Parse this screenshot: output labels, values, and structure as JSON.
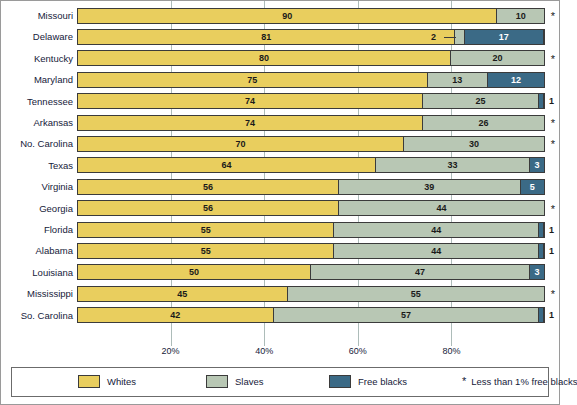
{
  "chart_data": {
    "type": "bar",
    "orientation": "horizontal",
    "stacked": true,
    "title": "",
    "xlabel": "",
    "ylabel": "",
    "xlim": [
      0,
      100
    ],
    "grid": true,
    "xticks": [
      "20%",
      "40%",
      "60%",
      "80%"
    ],
    "xtick_values": [
      20,
      40,
      60,
      80
    ],
    "legend_position": "bottom",
    "categories": [
      "Missouri",
      "Delaware",
      "Kentucky",
      "Maryland",
      "Tennessee",
      "Arkansas",
      "No. Carolina",
      "Texas",
      "Virginia",
      "Georgia",
      "Florida",
      "Alabama",
      "Louisiana",
      "Mississippi",
      "So. Carolina"
    ],
    "series": [
      {
        "name": "Whites",
        "color": "#e9ce5e",
        "values": [
          90,
          81,
          80,
          75,
          74,
          74,
          70,
          64,
          56,
          56,
          55,
          55,
          50,
          45,
          42
        ]
      },
      {
        "name": "Slaves",
        "color": "#b8c7b4",
        "values": [
          10,
          2,
          20,
          13,
          25,
          26,
          30,
          33,
          39,
          44,
          44,
          44,
          47,
          55,
          57
        ]
      },
      {
        "name": "Free blacks",
        "color": "#3b6a86",
        "values": [
          0,
          17,
          0,
          12,
          1,
          0,
          0,
          3,
          5,
          0,
          1,
          1,
          3,
          0,
          1
        ]
      }
    ],
    "footnote": "Less than 1% free blacks",
    "footnote_marker": "*",
    "rows": [
      {
        "label": "Missouri",
        "whites": 90,
        "slaves": 10,
        "free": 0,
        "free_label": "",
        "star": true,
        "slaves_outside": false,
        "leader": false
      },
      {
        "label": "Delaware",
        "whites": 81,
        "slaves": 2,
        "free": 17,
        "free_label": "17",
        "star": false,
        "slaves_outside": true,
        "leader": true
      },
      {
        "label": "Kentucky",
        "whites": 80,
        "slaves": 20,
        "free": 0,
        "free_label": "",
        "star": true,
        "slaves_outside": false,
        "leader": false
      },
      {
        "label": "Maryland",
        "whites": 75,
        "slaves": 13,
        "free": 12,
        "free_label": "12",
        "star": false,
        "slaves_outside": false,
        "leader": false
      },
      {
        "label": "Tennessee",
        "whites": 74,
        "slaves": 25,
        "free": 1,
        "free_label": "1",
        "star": false,
        "slaves_outside": false,
        "leader": false,
        "free_outside": true
      },
      {
        "label": "Arkansas",
        "whites": 74,
        "slaves": 26,
        "free": 0,
        "free_label": "",
        "star": true,
        "slaves_outside": false,
        "leader": false
      },
      {
        "label": "No. Carolina",
        "whites": 70,
        "slaves": 30,
        "free": 0,
        "free_label": "",
        "star": true,
        "slaves_outside": false,
        "leader": false
      },
      {
        "label": "Texas",
        "whites": 64,
        "slaves": 33,
        "free": 3,
        "free_label": "3",
        "star": false,
        "slaves_outside": false,
        "leader": false
      },
      {
        "label": "Virginia",
        "whites": 56,
        "slaves": 39,
        "free": 5,
        "free_label": "5",
        "star": false,
        "slaves_outside": false,
        "leader": false
      },
      {
        "label": "Georgia",
        "whites": 56,
        "slaves": 44,
        "free": 0,
        "free_label": "",
        "star": true,
        "slaves_outside": false,
        "leader": false
      },
      {
        "label": "Florida",
        "whites": 55,
        "slaves": 44,
        "free": 1,
        "free_label": "1",
        "star": false,
        "slaves_outside": false,
        "leader": false,
        "free_outside": true
      },
      {
        "label": "Alabama",
        "whites": 55,
        "slaves": 44,
        "free": 1,
        "free_label": "1",
        "star": false,
        "slaves_outside": false,
        "leader": false,
        "free_outside": true
      },
      {
        "label": "Louisiana",
        "whites": 50,
        "slaves": 47,
        "free": 3,
        "free_label": "3",
        "star": false,
        "slaves_outside": false,
        "leader": false
      },
      {
        "label": "Mississippi",
        "whites": 45,
        "slaves": 55,
        "free": 0,
        "free_label": "",
        "star": true,
        "slaves_outside": false,
        "leader": false
      },
      {
        "label": "So. Carolina",
        "whites": 42,
        "slaves": 57,
        "free": 1,
        "free_label": "1",
        "star": false,
        "slaves_outside": false,
        "leader": false,
        "free_outside": true
      }
    ]
  },
  "legend": {
    "items": [
      {
        "label": "Whites",
        "color": "#e9ce5e"
      },
      {
        "label": "Slaves",
        "color": "#b8c7b4"
      },
      {
        "label": "Free blacks",
        "color": "#3b6a86"
      }
    ],
    "note_marker": "*",
    "note": "Less than 1% free blacks"
  }
}
